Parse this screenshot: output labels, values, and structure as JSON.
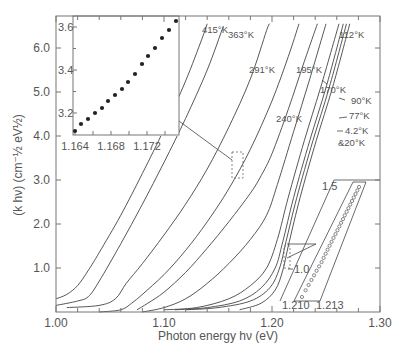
{
  "chart_data": {
    "type": "line",
    "title": "",
    "xlabel": "Photon energy hν (eV)",
    "ylabel": "(k hν) (cm⁻½ eV½)",
    "xlim": [
      1.0,
      1.3
    ],
    "ylim": [
      0.0,
      6.7
    ],
    "x_ticks": [
      "1.00",
      "1.10",
      "1.20",
      "1.30"
    ],
    "y_ticks": [
      "1.0",
      "2.0",
      "3.0",
      "4.0",
      "5.0",
      "6.0"
    ],
    "grid": false,
    "legend": "inline temperature labels",
    "series": [
      {
        "name": "415°K",
        "points": [
          [
            1.0,
            0.3
          ],
          [
            1.01,
            0.4
          ],
          [
            1.02,
            0.6
          ],
          [
            1.03,
            0.95
          ],
          [
            1.04,
            1.35
          ],
          [
            1.06,
            2.2
          ],
          [
            1.08,
            3.15
          ],
          [
            1.1,
            4.15
          ],
          [
            1.12,
            5.25
          ],
          [
            1.135,
            6.2
          ],
          [
            1.14,
            6.55
          ]
        ]
      },
      {
        "name": "363°K",
        "points": [
          [
            1.0,
            0.15
          ],
          [
            1.02,
            0.25
          ],
          [
            1.03,
            0.35
          ],
          [
            1.04,
            0.7
          ],
          [
            1.06,
            1.55
          ],
          [
            1.08,
            2.45
          ],
          [
            1.1,
            3.4
          ],
          [
            1.12,
            4.4
          ],
          [
            1.14,
            5.5
          ],
          [
            1.155,
            6.5
          ]
        ]
      },
      {
        "name": "291°K",
        "points": [
          [
            1.01,
            0.1
          ],
          [
            1.04,
            0.15
          ],
          [
            1.055,
            0.3
          ],
          [
            1.065,
            0.65
          ],
          [
            1.08,
            1.1
          ],
          [
            1.1,
            1.75
          ],
          [
            1.12,
            2.45
          ],
          [
            1.14,
            3.25
          ],
          [
            1.16,
            4.2
          ],
          [
            1.18,
            5.3
          ],
          [
            1.195,
            6.4
          ],
          [
            1.198,
            6.55
          ]
        ]
      },
      {
        "name": "240°K",
        "points": [
          [
            1.04,
            0.0
          ],
          [
            1.06,
            0.05
          ],
          [
            1.07,
            0.2
          ],
          [
            1.08,
            0.4
          ],
          [
            1.1,
            0.85
          ],
          [
            1.12,
            1.4
          ],
          [
            1.14,
            2.05
          ],
          [
            1.16,
            2.8
          ],
          [
            1.18,
            3.7
          ],
          [
            1.2,
            4.8
          ],
          [
            1.215,
            5.8
          ],
          [
            1.225,
            6.55
          ]
        ]
      },
      {
        "name": "195°K",
        "points": [
          [
            1.075,
            0.05
          ],
          [
            1.085,
            0.2
          ],
          [
            1.1,
            0.45
          ],
          [
            1.12,
            0.9
          ],
          [
            1.14,
            1.45
          ],
          [
            1.16,
            2.05
          ],
          [
            1.18,
            2.7
          ],
          [
            1.19,
            3.1
          ],
          [
            1.2,
            3.6
          ],
          [
            1.215,
            4.6
          ],
          [
            1.23,
            5.7
          ],
          [
            1.242,
            6.55
          ]
        ]
      },
      {
        "name": "170°K",
        "points": [
          [
            1.08,
            0.0
          ],
          [
            1.1,
            0.1
          ],
          [
            1.12,
            0.3
          ],
          [
            1.14,
            0.65
          ],
          [
            1.16,
            1.1
          ],
          [
            1.18,
            1.65
          ],
          [
            1.195,
            2.2
          ],
          [
            1.205,
            2.9
          ],
          [
            1.22,
            4.1
          ],
          [
            1.235,
            5.3
          ],
          [
            1.25,
            6.55
          ]
        ]
      },
      {
        "name": "112°K",
        "points": [
          [
            1.1,
            0.05
          ],
          [
            1.13,
            0.1
          ],
          [
            1.16,
            0.3
          ],
          [
            1.18,
            0.6
          ],
          [
            1.195,
            1.0
          ],
          [
            1.205,
            1.65
          ],
          [
            1.215,
            2.6
          ],
          [
            1.23,
            3.9
          ],
          [
            1.245,
            5.1
          ],
          [
            1.262,
            6.55
          ]
        ]
      },
      {
        "name": "90°K",
        "points": [
          [
            1.11,
            0.05
          ],
          [
            1.14,
            0.1
          ],
          [
            1.17,
            0.25
          ],
          [
            1.19,
            0.55
          ],
          [
            1.203,
            1.0
          ],
          [
            1.21,
            1.6
          ],
          [
            1.22,
            2.6
          ],
          [
            1.235,
            3.9
          ],
          [
            1.25,
            5.1
          ],
          [
            1.266,
            6.55
          ]
        ]
      },
      {
        "name": "77°K",
        "points": [
          [
            1.12,
            0.05
          ],
          [
            1.15,
            0.1
          ],
          [
            1.18,
            0.25
          ],
          [
            1.198,
            0.55
          ],
          [
            1.207,
            1.0
          ],
          [
            1.213,
            1.6
          ],
          [
            1.223,
            2.6
          ],
          [
            1.238,
            3.9
          ],
          [
            1.253,
            5.1
          ],
          [
            1.269,
            6.55
          ]
        ]
      },
      {
        "name": "4.2°K & 20°K",
        "points": [
          [
            1.17,
            0.05
          ],
          [
            1.19,
            0.2
          ],
          [
            1.203,
            0.5
          ],
          [
            1.21,
            0.95
          ],
          [
            1.216,
            1.6
          ],
          [
            1.226,
            2.6
          ],
          [
            1.241,
            3.9
          ],
          [
            1.256,
            5.1
          ],
          [
            1.272,
            6.55
          ]
        ]
      }
    ],
    "temperature_labels": [
      "415°K",
      "363°K",
      "291°K",
      "195°K",
      "240°K",
      "170°K",
      "112°K",
      "90°K",
      "77°K",
      "4.2°K",
      "&20°K"
    ],
    "insets": [
      {
        "type": "scatter",
        "marker": "filled",
        "x_ticks": [
          "1.164",
          "1.168",
          "1.172"
        ],
        "y_ticks": [
          "3.2",
          "3.4",
          "3.6"
        ],
        "xlim": [
          1.1638,
          1.173
        ],
        "ylim": [
          3.12,
          3.66
        ],
        "points": [
          [
            1.1642,
            3.13
          ],
          [
            1.1648,
            3.16
          ],
          [
            1.1656,
            3.18
          ],
          [
            1.1662,
            3.21
          ],
          [
            1.1669,
            3.24
          ],
          [
            1.1676,
            3.27
          ],
          [
            1.1683,
            3.29
          ],
          [
            1.169,
            3.32
          ],
          [
            1.1697,
            3.35
          ],
          [
            1.1704,
            3.39
          ],
          [
            1.1711,
            3.43
          ],
          [
            1.1718,
            3.47
          ],
          [
            1.1725,
            3.51
          ],
          [
            1.1732,
            3.55
          ],
          [
            1.1739,
            3.59
          ],
          [
            1.1746,
            3.63
          ]
        ]
      },
      {
        "type": "scatter",
        "marker": "open",
        "x_ticks": [
          "1.210",
          "1.213"
        ],
        "y_ticks": [
          "1.0",
          "1.5"
        ],
        "points_count": 28
      }
    ]
  }
}
